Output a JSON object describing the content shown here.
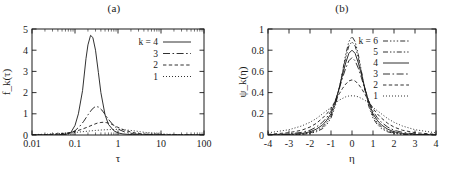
{
  "figure": {
    "panels": [
      {
        "caption": "(a)",
        "xlabel": "τ",
        "ylabel": "fₖ(τ)"
      },
      {
        "caption": "(b)",
        "xlabel": "η",
        "ylabel": "ψₖ(η)"
      }
    ]
  },
  "chart_data": [
    {
      "type": "line",
      "panel": "(a)",
      "title": "(a)",
      "xlabel": "τ",
      "ylabel": "f_k(τ)",
      "xscale": "log",
      "xlim": [
        0.01,
        100
      ],
      "ylim": [
        0,
        5
      ],
      "xticks": [
        0.01,
        0.1,
        1,
        10,
        100
      ],
      "xtick_labels": [
        "0.01",
        "0.1",
        "1",
        "10",
        "100"
      ],
      "yticks": [
        0,
        1,
        2,
        3,
        4,
        5
      ],
      "ytick_labels": [
        "0",
        "1",
        "2",
        "3",
        "4",
        "5"
      ],
      "grid": false,
      "legend_position": "upper-right",
      "legend_prefix": "k =",
      "series": [
        {
          "name": "4",
          "legend": "k = 4",
          "dash": "none",
          "peak_x": 0.23,
          "peak_y": 4.7,
          "x": [
            0.01,
            0.02,
            0.04,
            0.06,
            0.08,
            0.1,
            0.12,
            0.15,
            0.18,
            0.2,
            0.23,
            0.26,
            0.3,
            0.35,
            0.4,
            0.5,
            0.6,
            0.8,
            1,
            1.3,
            1.7,
            2.2,
            3,
            5,
            8,
            15,
            30,
            60,
            100
          ],
          "y": [
            0,
            0,
            0,
            0.02,
            0.12,
            0.45,
            1.0,
            2.1,
            3.6,
            4.25,
            4.7,
            4.6,
            4.0,
            2.95,
            2.0,
            0.95,
            0.5,
            0.2,
            0.1,
            0.05,
            0.03,
            0.02,
            0.01,
            0.005,
            0.002,
            0.001,
            0,
            0,
            0
          ]
        },
        {
          "name": "3",
          "legend": "3",
          "dash": "long-dash-dot",
          "peak_x": 0.3,
          "peak_y": 1.35,
          "x": [
            0.01,
            0.02,
            0.04,
            0.06,
            0.08,
            0.1,
            0.13,
            0.16,
            0.2,
            0.25,
            0.3,
            0.35,
            0.42,
            0.5,
            0.6,
            0.75,
            0.9,
            1.1,
            1.4,
            1.8,
            2.4,
            3.2,
            5,
            8,
            15,
            30,
            60,
            100
          ],
          "y": [
            0,
            0,
            0.01,
            0.04,
            0.1,
            0.2,
            0.42,
            0.65,
            0.95,
            1.22,
            1.35,
            1.32,
            1.18,
            0.97,
            0.74,
            0.5,
            0.35,
            0.24,
            0.15,
            0.09,
            0.05,
            0.03,
            0.015,
            0.007,
            0.003,
            0.001,
            0,
            0
          ]
        },
        {
          "name": "2",
          "legend": "2",
          "dash": "short-dash",
          "peak_x": 0.45,
          "peak_y": 0.6,
          "x": [
            0.01,
            0.02,
            0.04,
            0.07,
            0.1,
            0.14,
            0.2,
            0.26,
            0.33,
            0.4,
            0.45,
            0.55,
            0.65,
            0.8,
            1,
            1.2,
            1.5,
            2,
            2.6,
            3.5,
            5,
            8,
            15,
            30,
            60,
            100
          ],
          "y": [
            0.01,
            0.02,
            0.05,
            0.1,
            0.17,
            0.26,
            0.38,
            0.48,
            0.56,
            0.59,
            0.6,
            0.58,
            0.54,
            0.46,
            0.36,
            0.29,
            0.21,
            0.14,
            0.09,
            0.055,
            0.032,
            0.016,
            0.007,
            0.003,
            0.001,
            0
          ]
        },
        {
          "name": "1",
          "legend": "1",
          "dash": "dotted",
          "peak_x": 1.0,
          "peak_y": 0.26,
          "x": [
            0.01,
            0.02,
            0.04,
            0.07,
            0.1,
            0.15,
            0.22,
            0.3,
            0.4,
            0.55,
            0.7,
            0.85,
            1,
            1.2,
            1.5,
            1.9,
            2.5,
            3.3,
            4.5,
            6,
            9,
            14,
            25,
            45,
            70,
            100
          ],
          "y": [
            0.02,
            0.035,
            0.06,
            0.09,
            0.12,
            0.155,
            0.19,
            0.215,
            0.235,
            0.25,
            0.258,
            0.26,
            0.26,
            0.255,
            0.24,
            0.22,
            0.19,
            0.155,
            0.12,
            0.09,
            0.06,
            0.038,
            0.02,
            0.01,
            0.005,
            0.003
          ]
        }
      ]
    },
    {
      "type": "line",
      "panel": "(b)",
      "title": "(b)",
      "xlabel": "η",
      "ylabel": "ψ_k(η)",
      "xscale": "linear",
      "xlim": [
        -4,
        4
      ],
      "ylim": [
        0,
        1
      ],
      "xticks": [
        -4,
        -3,
        -2,
        -1,
        0,
        1,
        2,
        3,
        4
      ],
      "xtick_labels": [
        "-4",
        "-3",
        "-2",
        "-1",
        "0",
        "1",
        "2",
        "3",
        "4"
      ],
      "yticks": [
        0,
        0.2,
        0.4,
        0.6,
        0.8,
        1
      ],
      "ytick_labels": [
        "0",
        "0.2",
        "0.4",
        "0.6",
        "0.8",
        "1"
      ],
      "grid": false,
      "legend_position": "upper-right",
      "legend_prefix": "k =",
      "series": [
        {
          "name": "6",
          "legend": "k = 6",
          "dash": "dash-dot-dot",
          "peak_x": 0.0,
          "peak_y": 0.93,
          "x": [
            -4,
            -3,
            -2.4,
            -2,
            -1.7,
            -1.4,
            -1.2,
            -1,
            -0.8,
            -0.6,
            -0.45,
            -0.3,
            -0.15,
            0,
            0.15,
            0.3,
            0.45,
            0.6,
            0.8,
            1,
            1.2,
            1.4,
            1.7,
            2,
            2.4,
            3,
            4
          ],
          "y": [
            0,
            0,
            0.005,
            0.015,
            0.03,
            0.06,
            0.1,
            0.16,
            0.27,
            0.44,
            0.6,
            0.76,
            0.88,
            0.93,
            0.88,
            0.76,
            0.6,
            0.44,
            0.27,
            0.16,
            0.1,
            0.06,
            0.03,
            0.015,
            0.005,
            0,
            0
          ]
        },
        {
          "name": "5",
          "legend": "5",
          "dash": "dash-dot",
          "peak_x": 0.0,
          "peak_y": 0.88,
          "x": [
            -4,
            -3,
            -2.4,
            -2,
            -1.7,
            -1.4,
            -1.2,
            -1,
            -0.8,
            -0.6,
            -0.45,
            -0.3,
            -0.15,
            0,
            0.15,
            0.3,
            0.45,
            0.6,
            0.8,
            1,
            1.2,
            1.4,
            1.7,
            2,
            2.4,
            3,
            4
          ],
          "y": [
            0,
            0.003,
            0.008,
            0.02,
            0.04,
            0.075,
            0.12,
            0.18,
            0.29,
            0.45,
            0.59,
            0.73,
            0.84,
            0.88,
            0.84,
            0.73,
            0.59,
            0.45,
            0.29,
            0.18,
            0.12,
            0.075,
            0.04,
            0.02,
            0.008,
            0.003,
            0
          ]
        },
        {
          "name": "4",
          "legend": "4",
          "dash": "none",
          "peak_x": 0.0,
          "peak_y": 0.8,
          "x": [
            -4,
            -3,
            -2.4,
            -2,
            -1.7,
            -1.4,
            -1.2,
            -1,
            -0.8,
            -0.6,
            -0.45,
            -0.3,
            -0.15,
            0,
            0.15,
            0.3,
            0.45,
            0.6,
            0.8,
            1,
            1.2,
            1.4,
            1.7,
            2,
            2.4,
            3,
            4
          ],
          "y": [
            0,
            0.005,
            0.014,
            0.03,
            0.055,
            0.095,
            0.14,
            0.2,
            0.31,
            0.45,
            0.57,
            0.68,
            0.77,
            0.8,
            0.77,
            0.68,
            0.57,
            0.45,
            0.31,
            0.2,
            0.14,
            0.095,
            0.055,
            0.03,
            0.014,
            0.005,
            0
          ]
        },
        {
          "name": "3",
          "legend": "3",
          "dash": "long-dash-dot",
          "peak_x": 0.0,
          "peak_y": 0.73,
          "x": [
            -4,
            -3,
            -2.4,
            -2,
            -1.7,
            -1.4,
            -1.2,
            -1,
            -0.8,
            -0.6,
            -0.45,
            -0.3,
            -0.15,
            0,
            0.15,
            0.3,
            0.45,
            0.6,
            0.8,
            1,
            1.2,
            1.4,
            1.7,
            2,
            2.4,
            3,
            4
          ],
          "y": [
            0.002,
            0.01,
            0.025,
            0.045,
            0.075,
            0.12,
            0.165,
            0.225,
            0.32,
            0.44,
            0.54,
            0.63,
            0.7,
            0.73,
            0.7,
            0.63,
            0.54,
            0.44,
            0.32,
            0.225,
            0.165,
            0.12,
            0.075,
            0.045,
            0.025,
            0.01,
            0.002
          ]
        },
        {
          "name": "2",
          "legend": "2",
          "dash": "short-dash",
          "peak_x": 0.0,
          "peak_y": 0.52,
          "x": [
            -4,
            -3,
            -2.4,
            -2,
            -1.7,
            -1.4,
            -1.2,
            -1,
            -0.8,
            -0.6,
            -0.45,
            -0.3,
            -0.15,
            0,
            0.15,
            0.3,
            0.45,
            0.6,
            0.8,
            1,
            1.2,
            1.4,
            1.7,
            2,
            2.4,
            3,
            4
          ],
          "y": [
            0.006,
            0.022,
            0.045,
            0.075,
            0.11,
            0.16,
            0.2,
            0.25,
            0.32,
            0.39,
            0.44,
            0.48,
            0.51,
            0.52,
            0.51,
            0.48,
            0.44,
            0.39,
            0.32,
            0.25,
            0.2,
            0.16,
            0.11,
            0.075,
            0.045,
            0.022,
            0.006
          ]
        },
        {
          "name": "1",
          "legend": "1",
          "dash": "dotted",
          "peak_x": 0.0,
          "peak_y": 0.37,
          "x": [
            -4,
            -3,
            -2.4,
            -2,
            -1.7,
            -1.4,
            -1.2,
            -1,
            -0.8,
            -0.6,
            -0.45,
            -0.3,
            -0.15,
            0,
            0.15,
            0.3,
            0.45,
            0.6,
            0.8,
            1,
            1.2,
            1.4,
            1.7,
            2,
            2.4,
            3,
            4
          ],
          "y": [
            0.02,
            0.05,
            0.085,
            0.12,
            0.155,
            0.2,
            0.23,
            0.26,
            0.3,
            0.33,
            0.345,
            0.36,
            0.368,
            0.37,
            0.368,
            0.36,
            0.345,
            0.33,
            0.3,
            0.26,
            0.23,
            0.2,
            0.155,
            0.12,
            0.085,
            0.05,
            0.02
          ]
        }
      ]
    }
  ]
}
